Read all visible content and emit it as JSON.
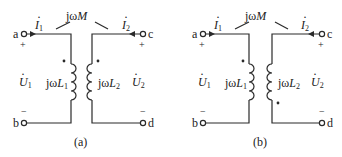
{
  "panels": [
    {
      "caption": "(a)",
      "mutual_label_prefix": "jω",
      "mutual_label_var": "M",
      "current_left": {
        "symbol": "I",
        "sub": "1"
      },
      "current_right": {
        "symbol": "I",
        "sub": "2"
      },
      "voltage_left": {
        "symbol": "U",
        "sub": "1"
      },
      "voltage_right": {
        "symbol": "U",
        "sub": "2"
      },
      "inductor_left": {
        "prefix": "jω",
        "symbol": "L",
        "sub": "1"
      },
      "inductor_right": {
        "prefix": "jω",
        "symbol": "L",
        "sub": "2"
      },
      "terminals": {
        "tl": "a",
        "bl": "b",
        "tr": "c",
        "br": "d"
      },
      "plus": "+",
      "minus": "−",
      "dot_positions": {
        "L1": "top",
        "L2": "top"
      }
    },
    {
      "caption": "(b)",
      "mutual_label_prefix": "jω",
      "mutual_label_var": "M",
      "current_left": {
        "symbol": "I",
        "sub": "1"
      },
      "current_right": {
        "symbol": "I",
        "sub": "2"
      },
      "voltage_left": {
        "symbol": "U",
        "sub": "1"
      },
      "voltage_right": {
        "symbol": "U",
        "sub": "2"
      },
      "inductor_left": {
        "prefix": "jω",
        "symbol": "L",
        "sub": "1"
      },
      "inductor_right": {
        "prefix": "jω",
        "symbol": "L",
        "sub": "2"
      },
      "terminals": {
        "tl": "a",
        "bl": "b",
        "tr": "c",
        "br": "d"
      },
      "plus": "+",
      "minus": "−",
      "dot_positions": {
        "L1": "top",
        "L2": "bottom"
      }
    }
  ],
  "colors": {
    "line": "#2a2a2a",
    "background": "#ffffff"
  }
}
